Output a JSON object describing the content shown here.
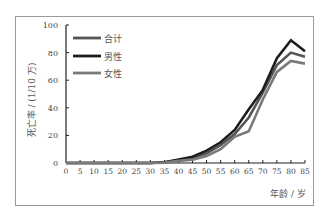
{
  "chart_data": {
    "type": "line",
    "title": "",
    "xlabel": "年龄 / 岁",
    "ylabel": "死亡率 / (1/10 万)",
    "xlim": [
      0,
      85
    ],
    "ylim": [
      0,
      100
    ],
    "x_ticks": [
      0,
      5,
      10,
      15,
      20,
      25,
      30,
      35,
      40,
      45,
      50,
      55,
      60,
      65,
      70,
      75,
      80,
      85
    ],
    "y_ticks": [
      0,
      20,
      40,
      60,
      80,
      100
    ],
    "grid": false,
    "legend_position": "upper-left-inside",
    "x": [
      0,
      5,
      10,
      15,
      20,
      25,
      30,
      35,
      40,
      45,
      50,
      55,
      60,
      65,
      70,
      75,
      80,
      85
    ],
    "series": [
      {
        "name": "合计",
        "color": "#555555",
        "values": [
          0,
          0,
          0,
          0,
          0,
          0,
          0,
          0.5,
          2,
          3.5,
          7,
          13,
          21,
          33,
          51,
          71,
          80,
          77
        ]
      },
      {
        "name": "男性",
        "color": "#1e1e1e",
        "values": [
          0,
          0,
          0,
          0,
          0,
          0,
          0,
          0.6,
          2.5,
          4.5,
          9,
          15,
          24,
          39,
          53,
          76,
          89,
          81
        ]
      },
      {
        "name": "女性",
        "color": "#7a7a7a",
        "values": [
          0,
          0,
          0,
          0,
          0,
          0,
          0,
          0.3,
          1.5,
          2.5,
          5,
          10,
          19,
          23,
          46,
          66,
          74,
          72
        ]
      }
    ]
  },
  "legend": {
    "items": [
      {
        "label": "合计",
        "color": "#555555"
      },
      {
        "label": "男性",
        "color": "#1e1e1e"
      },
      {
        "label": "女性",
        "color": "#7a7a7a"
      }
    ]
  },
  "axes": {
    "x_label": "年龄 / 岁",
    "y_label": "死亡率 / (1/10 万)"
  }
}
